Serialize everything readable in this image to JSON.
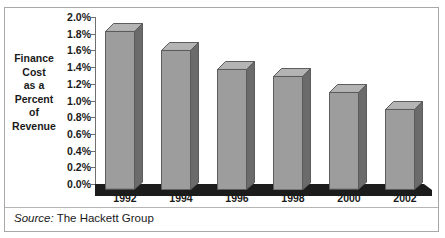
{
  "chart_data": {
    "type": "bar",
    "title": "",
    "xlabel": "",
    "ylabel": "Finance Cost as a Percent of Revenue",
    "categories": [
      "1992",
      "1994",
      "1996",
      "1998",
      "2000",
      "2002"
    ],
    "values": [
      1.9,
      1.68,
      1.45,
      1.37,
      1.17,
      0.97
    ],
    "value_labels": [
      "1.90%",
      "1.68%",
      "1.45%",
      "1.37%",
      "1.17%",
      "0.97%"
    ],
    "ylim": [
      0.0,
      2.0
    ],
    "ytick_values": [
      0.0,
      0.2,
      0.4,
      0.6,
      0.8,
      1.0,
      1.2,
      1.4,
      1.6,
      1.8,
      2.0
    ],
    "ytick_labels": [
      "0.0%",
      "0.2%",
      "0.4%",
      "0.6%",
      "0.8%",
      "1.0%",
      "1.2%",
      "1.4%",
      "1.6%",
      "1.8%",
      "2.0%"
    ],
    "grid": false,
    "legend": "none",
    "style": "3d-columns"
  },
  "axis_title_lines": [
    "Finance",
    "Cost",
    "as a",
    "Percent",
    "of",
    "Revenue"
  ],
  "footer": {
    "source_key": "Source:",
    "source_value": "The Hackett Group"
  },
  "colors": {
    "bar_face": "#9d9d9d",
    "bar_top": "#b4b4b4",
    "bar_side": "#6b6b6b",
    "bar_outline": "#5b5b5b",
    "floor": "#1c1c1c",
    "axis": "#6f6f6f",
    "text": "#1a1a1a",
    "panel_border": "#a8a8a8",
    "background": "#ffffff"
  }
}
